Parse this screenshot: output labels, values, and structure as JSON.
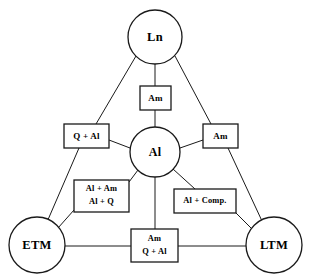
{
  "diagram": {
    "background_color": "#ffffff",
    "stroke_color": "#1a1a1a",
    "nodes": [
      {
        "id": "ln",
        "label": "Ln",
        "shape": "circle",
        "cx": 155,
        "cy": 37,
        "r": 27
      },
      {
        "id": "al",
        "label": "Al",
        "shape": "circle",
        "cx": 155,
        "cy": 152,
        "r": 25
      },
      {
        "id": "etm",
        "label": "ETM",
        "shape": "circle",
        "cx": 37,
        "cy": 245,
        "r": 28
      },
      {
        "id": "ltm",
        "label": "LTM",
        "shape": "circle",
        "cx": 274,
        "cy": 245,
        "r": 28
      }
    ],
    "boxes": [
      {
        "id": "box-am-top",
        "lines": [
          "Am"
        ],
        "x": 140,
        "y": 86,
        "w": 31,
        "h": 24
      },
      {
        "id": "box-q-al-left",
        "lines": [
          "Q + Al"
        ],
        "x": 64,
        "y": 124,
        "w": 45,
        "h": 24
      },
      {
        "id": "box-am-right",
        "lines": [
          "Am"
        ],
        "x": 203,
        "y": 124,
        "w": 35,
        "h": 24
      },
      {
        "id": "box-al-am-al-q",
        "lines": [
          "Al + Am",
          "Al + Q"
        ],
        "x": 74,
        "y": 180,
        "w": 55,
        "h": 32
      },
      {
        "id": "box-al-comp",
        "lines": [
          "Al + Comp."
        ],
        "x": 174,
        "y": 189,
        "w": 62,
        "h": 24
      },
      {
        "id": "box-am-q-al-bot",
        "lines": [
          "Am",
          "Q + Al"
        ],
        "x": 131,
        "y": 229,
        "w": 47,
        "h": 33
      }
    ],
    "edges": [
      {
        "id": "edge-ln-qal",
        "from": "Ln",
        "to": "Q + Al box"
      },
      {
        "id": "edge-qal-etm",
        "from": "Q + Al box",
        "to": "ETM"
      },
      {
        "id": "edge-ln-amright",
        "from": "Ln",
        "to": "Am (right) box"
      },
      {
        "id": "edge-amright-ltm",
        "from": "Am (right) box",
        "to": "LTM"
      },
      {
        "id": "edge-ln-amtop",
        "from": "Ln",
        "to": "Am (top) box"
      },
      {
        "id": "edge-amtop-al",
        "from": "Am (top) box",
        "to": "Al"
      },
      {
        "id": "edge-al-qal",
        "from": "Al",
        "to": "Q + Al box"
      },
      {
        "id": "edge-al-amright",
        "from": "Al",
        "to": "Am (right) box"
      },
      {
        "id": "edge-al-alamalq",
        "from": "Al",
        "to": "Al + Am / Al + Q box"
      },
      {
        "id": "edge-alamalq-etm",
        "from": "Al + Am / Al + Q box",
        "to": "ETM"
      },
      {
        "id": "edge-al-alcomp",
        "from": "Al",
        "to": "Al + Comp. box"
      },
      {
        "id": "edge-alcomp-ltm",
        "from": "Al + Comp. box",
        "to": "LTM"
      },
      {
        "id": "edge-al-ambot",
        "from": "Al",
        "to": "Am / Q + Al box"
      },
      {
        "id": "edge-etm-ambot",
        "from": "ETM",
        "to": "Am / Q + Al box"
      },
      {
        "id": "edge-ambot-ltm",
        "from": "Am / Q + Al box",
        "to": "LTM"
      }
    ]
  }
}
